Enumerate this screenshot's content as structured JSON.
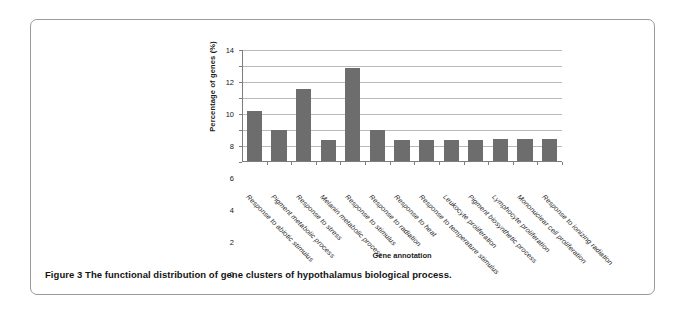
{
  "figure": {
    "caption": "Figure 3 The functional distribution of gene clusters of hypothalamus biological process."
  },
  "chart_data": {
    "type": "bar",
    "title": "",
    "xlabel": "Gene annotation",
    "ylabel": "Percentage of genes (%)",
    "ylim": [
      0,
      14
    ],
    "ytick_step": 2,
    "yticks": [
      0,
      2,
      4,
      6,
      8,
      10,
      12,
      14
    ],
    "ytick_labels": [
      "0",
      "2",
      "4",
      "6",
      "8",
      "10",
      "12",
      "14"
    ],
    "grid": true,
    "grid_axis": "y",
    "legend": false,
    "bar_color": "#6d6d6d",
    "categories": [
      "Response to abiotic stimulus",
      "Pigment metabolic process",
      "Response to stress",
      "Melanin metabolic process",
      "Response to stimulus",
      "Response to radiation",
      "Response to heat",
      "Response to temperature stimulus",
      "Leukocyte proliferation",
      "Pigment biosynthetic process",
      "Lymphocyte proliferation",
      "Mononuclear cell proliferation",
      "Response to ionizing radiation"
    ],
    "values": [
      6.3,
      3.85,
      9.0,
      2.6,
      11.6,
      3.9,
      2.65,
      2.65,
      2.65,
      2.65,
      2.7,
      2.75,
      2.75
    ]
  }
}
